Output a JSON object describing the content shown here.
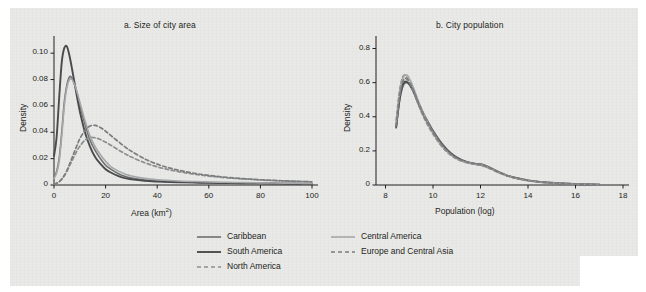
{
  "figure": {
    "background_color": "#e9e9e7",
    "ink_color": "#231f20"
  },
  "legend": {
    "position": "bottom-center",
    "entries": [
      {
        "label": "Caribbean",
        "color": "#6f7072",
        "style": "solid",
        "width": 1.6,
        "col": 0,
        "row": 0
      },
      {
        "label": "South America",
        "color": "#4a4b4d",
        "style": "solid",
        "width": 1.9,
        "col": 0,
        "row": 1
      },
      {
        "label": "North America",
        "color": "#8d8e90",
        "style": "dashed",
        "width": 1.7,
        "col": 0,
        "row": 2
      },
      {
        "label": "Central America",
        "color": "#a6a7a9",
        "style": "solid",
        "width": 1.6,
        "col": 1,
        "row": 0
      },
      {
        "label": "Europe and Central Asia",
        "color": "#7b7c7e",
        "style": "dashed",
        "width": 1.7,
        "col": 1,
        "row": 1
      }
    ]
  },
  "chart_data": [
    {
      "id": "panel-a",
      "type": "line",
      "title": "a. Size of city area",
      "xlabel": "Area (km²)",
      "ylabel": "Density",
      "xlim": [
        0,
        100
      ],
      "ylim": [
        0,
        0.11
      ],
      "xticks": [
        0,
        20,
        40,
        60,
        80,
        100
      ],
      "xticklabels": [
        "0",
        "20",
        "40",
        "60",
        "80",
        "100"
      ],
      "yticks": [
        0,
        0.02,
        0.04,
        0.06,
        0.08,
        0.1
      ],
      "yticklabels": [
        "0",
        "0.02",
        "0.04",
        "0.06",
        "0.08",
        "0.10"
      ],
      "grid": false,
      "x": [
        0,
        1,
        2,
        3,
        4,
        5,
        6,
        7,
        8,
        9,
        10,
        12,
        14,
        16,
        18,
        20,
        22,
        25,
        28,
        30,
        35,
        40,
        45,
        50,
        55,
        60,
        65,
        70,
        75,
        80,
        85,
        90,
        95,
        100
      ],
      "series": [
        {
          "name": "Caribbean",
          "color": "#6f7072",
          "style": "solid",
          "values": [
            0.006,
            0.01,
            0.02,
            0.04,
            0.063,
            0.076,
            0.082,
            0.081,
            0.076,
            0.069,
            0.061,
            0.046,
            0.034,
            0.026,
            0.02,
            0.015,
            0.012,
            0.0085,
            0.0062,
            0.0052,
            0.0038,
            0.003,
            0.0026,
            0.0022,
            0.002,
            0.0018,
            0.0016,
            0.0015,
            0.0014,
            0.0013,
            0.0012,
            0.0011,
            0.001,
            0.0009
          ]
        },
        {
          "name": "South America",
          "color": "#4a4b4d",
          "style": "solid",
          "values": [
            0.022,
            0.036,
            0.066,
            0.093,
            0.104,
            0.105,
            0.098,
            0.088,
            0.077,
            0.066,
            0.056,
            0.04,
            0.029,
            0.021,
            0.016,
            0.012,
            0.0095,
            0.0068,
            0.005,
            0.0043,
            0.0032,
            0.0026,
            0.0022,
            0.002,
            0.0018,
            0.0016,
            0.0015,
            0.0014,
            0.0013,
            0.0012,
            0.0011,
            0.001,
            0.0009,
            0.0008
          ]
        },
        {
          "name": "North America",
          "color": "#8d8e90",
          "style": "dashed",
          "values": [
            0.0008,
            0.0014,
            0.0026,
            0.0046,
            0.0072,
            0.0105,
            0.0145,
            0.0185,
            0.0225,
            0.0262,
            0.0294,
            0.034,
            0.036,
            0.0358,
            0.0345,
            0.0325,
            0.0302,
            0.0266,
            0.0232,
            0.0212,
            0.017,
            0.0138,
            0.0114,
            0.0095,
            0.008,
            0.0068,
            0.0058,
            0.005,
            0.0044,
            0.0038,
            0.0034,
            0.003,
            0.0027,
            0.0024
          ]
        },
        {
          "name": "Central America",
          "color": "#a6a7a9",
          "style": "solid",
          "values": [
            0.005,
            0.009,
            0.018,
            0.037,
            0.06,
            0.074,
            0.08,
            0.08,
            0.076,
            0.07,
            0.063,
            0.049,
            0.037,
            0.029,
            0.023,
            0.018,
            0.014,
            0.0105,
            0.008,
            0.0068,
            0.005,
            0.004,
            0.0034,
            0.0029,
            0.0026,
            0.0023,
            0.0021,
            0.0019,
            0.0018,
            0.0016,
            0.0015,
            0.0014,
            0.0013,
            0.0012
          ]
        },
        {
          "name": "Europe and Central Asia",
          "color": "#7b7c7e",
          "style": "dashed",
          "values": [
            0.0006,
            0.0012,
            0.0024,
            0.0044,
            0.0072,
            0.011,
            0.0156,
            0.0206,
            0.0256,
            0.0305,
            0.035,
            0.0415,
            0.0448,
            0.0452,
            0.0436,
            0.0408,
            0.0376,
            0.0328,
            0.0282,
            0.0256,
            0.02,
            0.0158,
            0.0128,
            0.0105,
            0.0087,
            0.0073,
            0.0062,
            0.0053,
            0.0046,
            0.004,
            0.0035,
            0.0031,
            0.0027,
            0.0024
          ]
        }
      ]
    },
    {
      "id": "panel-b",
      "type": "line",
      "title": "b. City population",
      "xlabel": "Population (log)",
      "ylabel": "Density",
      "xlim": [
        7.6,
        18
      ],
      "ylim": [
        0,
        0.85
      ],
      "xticks": [
        8,
        10,
        12,
        14,
        16,
        18
      ],
      "xticklabels": [
        "8",
        "10",
        "12",
        "14",
        "16",
        "18"
      ],
      "yticks": [
        0,
        0.2,
        0.4,
        0.6,
        0.8
      ],
      "yticklabels": [
        "0",
        "0.2",
        "0.4",
        "0.6",
        "0.8"
      ],
      "grid": false,
      "x": [
        8.45,
        8.6,
        8.75,
        8.9,
        9.05,
        9.2,
        9.4,
        9.6,
        9.8,
        10.0,
        10.3,
        10.6,
        10.9,
        11.2,
        11.5,
        11.8,
        12.0,
        12.2,
        12.5,
        12.8,
        13.1,
        13.5,
        14.0,
        14.5,
        15.0,
        15.5,
        16.0,
        16.5,
        17.0
      ],
      "series": [
        {
          "name": "Caribbean",
          "color": "#6f7072",
          "style": "solid",
          "values": [
            0.335,
            0.5,
            0.585,
            0.6,
            0.585,
            0.545,
            0.48,
            0.42,
            0.37,
            0.32,
            0.258,
            0.208,
            0.172,
            0.148,
            0.132,
            0.122,
            0.118,
            0.11,
            0.092,
            0.072,
            0.056,
            0.04,
            0.026,
            0.018,
            0.013,
            0.009,
            0.006,
            0.004,
            0.002
          ]
        },
        {
          "name": "South America",
          "color": "#4a4b4d",
          "style": "solid",
          "values": [
            0.34,
            0.51,
            0.595,
            0.605,
            0.58,
            0.54,
            0.472,
            0.412,
            0.36,
            0.312,
            0.25,
            0.202,
            0.168,
            0.146,
            0.132,
            0.124,
            0.122,
            0.114,
            0.094,
            0.074,
            0.057,
            0.041,
            0.027,
            0.018,
            0.013,
            0.009,
            0.006,
            0.004,
            0.002
          ]
        },
        {
          "name": "North America",
          "color": "#8d8e90",
          "style": "dashed",
          "values": [
            0.38,
            0.56,
            0.64,
            0.63,
            0.59,
            0.54,
            0.466,
            0.4,
            0.346,
            0.298,
            0.238,
            0.192,
            0.16,
            0.14,
            0.128,
            0.12,
            0.116,
            0.108,
            0.09,
            0.07,
            0.054,
            0.039,
            0.025,
            0.017,
            0.012,
            0.008,
            0.005,
            0.003,
            0.002
          ]
        },
        {
          "name": "Central America",
          "color": "#a6a7a9",
          "style": "solid",
          "values": [
            0.36,
            0.545,
            0.63,
            0.645,
            0.612,
            0.562,
            0.486,
            0.418,
            0.36,
            0.308,
            0.244,
            0.196,
            0.162,
            0.142,
            0.13,
            0.122,
            0.12,
            0.112,
            0.093,
            0.073,
            0.056,
            0.04,
            0.026,
            0.018,
            0.013,
            0.009,
            0.006,
            0.004,
            0.002
          ]
        },
        {
          "name": "Europe and Central Asia",
          "color": "#7b7c7e",
          "style": "dashed",
          "values": [
            0.345,
            0.525,
            0.612,
            0.622,
            0.592,
            0.548,
            0.478,
            0.414,
            0.358,
            0.31,
            0.248,
            0.2,
            0.166,
            0.145,
            0.132,
            0.124,
            0.12,
            0.112,
            0.093,
            0.073,
            0.056,
            0.041,
            0.027,
            0.018,
            0.013,
            0.009,
            0.006,
            0.004,
            0.002
          ]
        }
      ]
    }
  ]
}
